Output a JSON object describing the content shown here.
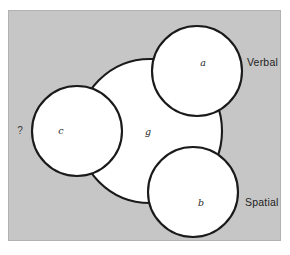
{
  "figure": {
    "background_color": "#ffffff",
    "panel_color": "#c6c6c6",
    "panel_border_color": "#b2b2b2",
    "stroke_color": "#1a1a1a",
    "circle_fill": "#ffffff"
  },
  "diagram": {
    "type": "venn",
    "circles": [
      {
        "id": "g",
        "label": "g",
        "cx": 150,
        "cy": 131,
        "r": 72,
        "label_x": 148,
        "label_y": 132
      },
      {
        "id": "a",
        "label": "a",
        "cx": 197,
        "cy": 71,
        "r": 45,
        "label_x": 203,
        "label_y": 63
      },
      {
        "id": "b",
        "label": "b",
        "cx": 193,
        "cy": 192,
        "r": 45,
        "label_x": 201,
        "label_y": 203
      },
      {
        "id": "c",
        "label": "c",
        "cx": 77,
        "cy": 131,
        "r": 45,
        "label_x": 61,
        "label_y": 131
      }
    ],
    "annotations": [
      {
        "id": "verbal",
        "text": "Verbal",
        "x": 247,
        "y": 63
      },
      {
        "id": "spatial",
        "text": "Spatial",
        "x": 245,
        "y": 203
      }
    ],
    "query": {
      "text": "?",
      "x": 20,
      "y": 131
    }
  }
}
